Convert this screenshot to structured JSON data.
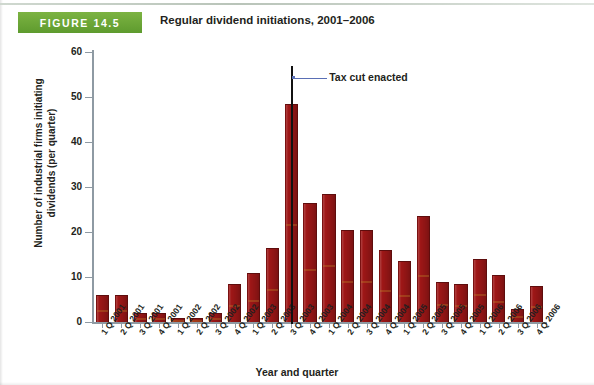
{
  "figure": {
    "badge_label": "FIGURE 14.5",
    "title": "Regular dividend initiations, 2001–2006"
  },
  "annotation": {
    "label": "Tax cut enacted",
    "at_category": "3 Q 2003",
    "line_color": "#111111",
    "leader_color": "#5a6fb5"
  },
  "colors": {
    "bar_fill": "#9e1717",
    "bar_edge": "#5e0d0d",
    "badge_green": "#5e9b2e",
    "axis": "#8e9aa3",
    "text": "#231f20"
  },
  "chart_data": {
    "type": "bar",
    "title": "Regular dividend initiations, 2001–2006",
    "xlabel": "Year and quarter",
    "ylabel": "Number of industrial firms initiating dividends (per quarter)",
    "ylim": [
      0,
      60
    ],
    "yticks": [
      0,
      10,
      20,
      30,
      40,
      50,
      60
    ],
    "grid": false,
    "legend": "none",
    "categories": [
      "1 Q 2001",
      "2 Q 2001",
      "3 Q 2001",
      "4 Q 2001",
      "1 Q 2002",
      "2 Q 2002",
      "3 Q 2002",
      "4 Q 2002",
      "1 Q 2003",
      "2 Q 2003",
      "3 Q 2003",
      "4 Q 2003",
      "1 Q 2004",
      "2 Q 2004",
      "3 Q 2004",
      "4 Q 2004",
      "1 Q 2005",
      "2 Q 2005",
      "3 Q 2005",
      "4 Q 2005",
      "1 Q 2006",
      "2 Q 2006",
      "3 Q 2006",
      "4 Q 2006"
    ],
    "values": [
      6,
      6,
      2,
      2,
      1,
      1,
      2,
      8.5,
      11,
      16.5,
      48.5,
      26.5,
      28.5,
      20.5,
      20.5,
      16,
      13.5,
      23.5,
      9,
      8.5,
      14,
      10.5,
      3,
      8
    ],
    "annotations": [
      {
        "text": "Tax cut enacted",
        "at_category": "3 Q 2003",
        "type": "vertical-line"
      }
    ]
  }
}
